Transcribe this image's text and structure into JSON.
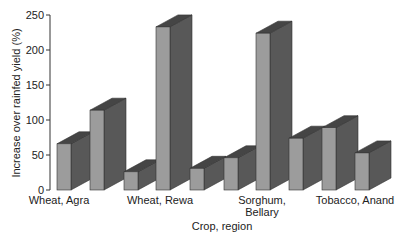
{
  "chart_data": {
    "type": "bar",
    "title": "",
    "xlabel": "Crop, region",
    "ylabel": "Increase over rainfed yield (%)",
    "ylim": [
      0,
      250
    ],
    "yticks": [
      0,
      50,
      100,
      150,
      200,
      250
    ],
    "categories": [
      "Wheat, Agra",
      "Wheat, Rewa",
      "Sorghum, Bellary",
      "Tobacco, Anand"
    ],
    "category_label_lines": [
      [
        "Wheat, Agra"
      ],
      [
        "Wheat, Rewa"
      ],
      [
        "Sorghum,",
        "Bellary"
      ],
      [
        "Tobacco, Anand"
      ]
    ],
    "bars": [
      66,
      114,
      26,
      233,
      31,
      46,
      224,
      74,
      89,
      53
    ],
    "grid": false,
    "legend": null,
    "style": "3d-bars",
    "colors": {
      "front": "#9c9c9c",
      "side": "#585858",
      "top": "#454545",
      "axis": "#333333"
    }
  }
}
